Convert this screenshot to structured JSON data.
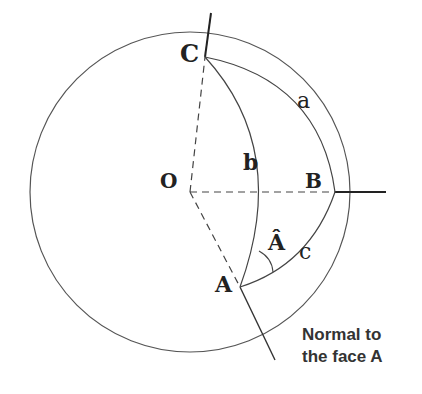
{
  "diagram": {
    "points": {
      "O": {
        "label": "O",
        "x": 190,
        "y": 192
      },
      "A": {
        "label": "A",
        "x": 240,
        "y": 287
      },
      "B": {
        "label": "B",
        "x": 335,
        "y": 192
      },
      "C": {
        "label": "C",
        "x": 205,
        "y": 57
      }
    },
    "sides": {
      "a": {
        "label": "a",
        "from": "C",
        "to": "B"
      },
      "b": {
        "label": "b",
        "from": "C",
        "to": "A"
      },
      "c": {
        "label": "c",
        "from": "A",
        "to": "B"
      }
    },
    "angle": {
      "label": "Â",
      "vertex": "A"
    },
    "caption": {
      "line1": "Normal to",
      "line2": "the face A"
    },
    "colors": {
      "stroke": "#333333",
      "text": "#222222"
    }
  }
}
